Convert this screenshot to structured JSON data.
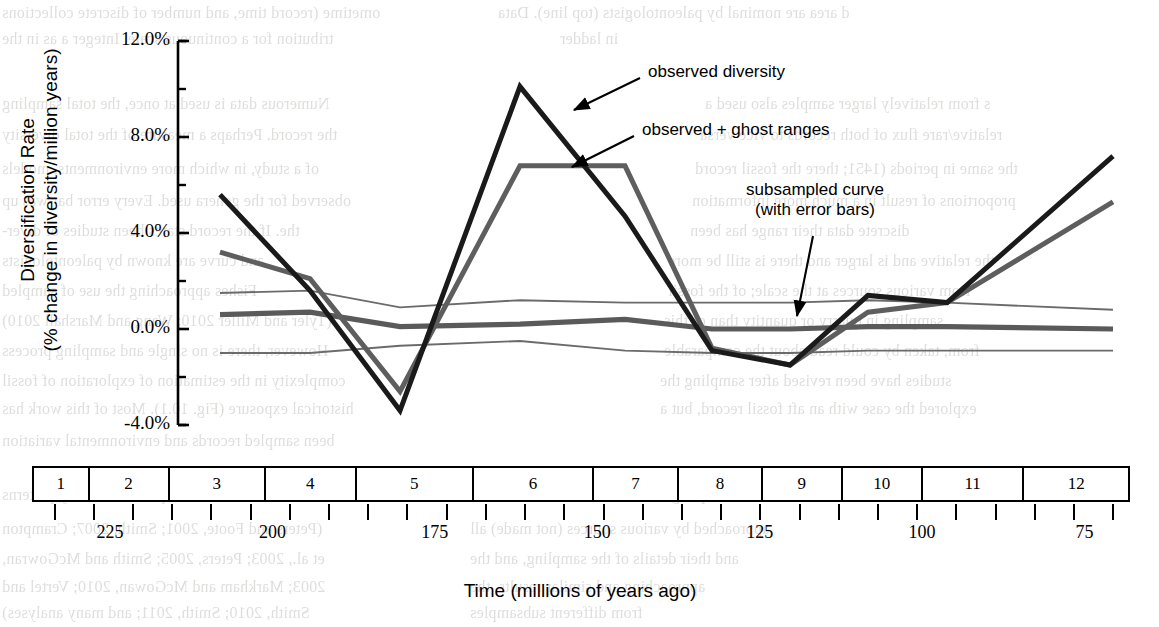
{
  "figure": {
    "y_axis": {
      "title_line1": "Diversification Rate",
      "title_line2": "(% change in diversity/million years)",
      "ticks": [
        "12.0%",
        "8.0%",
        "4.0%",
        "0.0%",
        "-4.0%"
      ]
    },
    "x_axis": {
      "title": "Time (millions of years ago)",
      "bins": [
        "1",
        "2",
        "3",
        "4",
        "5",
        "6",
        "7",
        "8",
        "9",
        "10",
        "11",
        "12"
      ],
      "tick_labels": [
        "225",
        "200",
        "175",
        "150",
        "125",
        "100",
        "75"
      ]
    },
    "annotations": [
      {
        "name": "observed-diversity",
        "text": "observed diversity"
      },
      {
        "name": "observed-ghost-ranges",
        "text": "observed + ghost ranges"
      },
      {
        "name": "subsampled-curve",
        "line1": "subsampled curve",
        "line2": "(with error bars)"
      }
    ],
    "colors": {
      "observed": "#1a1a1a",
      "ghost": "#5e5e5e",
      "subsampled": "#5a5a5a",
      "error_band": "#6b6b6b",
      "axis": "#000000",
      "background": "#ffffff"
    }
  },
  "chart_data": {
    "type": "line",
    "title": "",
    "xlabel": "Time (millions of years ago)",
    "ylabel": "Diversification Rate (% change in diversity/million years)",
    "ylim": [
      -4.0,
      12.0
    ],
    "yticks": [
      -4.0,
      0.0,
      4.0,
      8.0,
      12.0
    ],
    "ytick_labels": [
      "-4.0%",
      "0.0%",
      "4.0%",
      "8.0%",
      "12.0%"
    ],
    "grid": false,
    "legend": "annotations-with-arrows",
    "x": [
      3,
      4,
      5,
      6,
      7,
      8,
      9,
      10,
      11,
      12
    ],
    "x_bins": [
      "3",
      "4",
      "5",
      "6",
      "7",
      "8",
      "9",
      "10",
      "11",
      "12"
    ],
    "x_time_mya": [
      212,
      193,
      178,
      162,
      146,
      130,
      116,
      101,
      88,
      74
    ],
    "series": [
      {
        "name": "observed diversity",
        "color": "#1a1a1a",
        "values": [
          5.6,
          1.6,
          -3.4,
          10.1,
          4.7,
          -0.9,
          -1.5,
          1.4,
          1.1,
          7.2
        ]
      },
      {
        "name": "observed + ghost ranges",
        "color": "#5e5e5e",
        "values": [
          3.2,
          2.1,
          -2.6,
          6.8,
          6.8,
          -0.8,
          -1.5,
          0.7,
          1.1,
          5.3
        ]
      },
      {
        "name": "subsampled curve",
        "color": "#5a5a5a",
        "values": [
          0.6,
          0.7,
          0.1,
          0.2,
          0.4,
          0.0,
          0.0,
          0.1,
          0.1,
          0.0
        ]
      },
      {
        "name": "subsampled upper error",
        "color": "#6b6b6b",
        "values": [
          1.5,
          1.6,
          0.9,
          1.2,
          1.1,
          1.1,
          1.1,
          1.2,
          1.1,
          0.8
        ]
      },
      {
        "name": "subsampled lower error",
        "color": "#6b6b6b",
        "values": [
          -1.0,
          -1.0,
          -0.7,
          -0.5,
          -0.9,
          -1.0,
          -1.0,
          -0.9,
          -0.9,
          -0.9
        ]
      }
    ]
  },
  "bleed_text": {
    "lines": [
      {
        "t": "d area are nominal by paleontologists (top line). Data",
        "x": 498,
        "y": 4
      },
      {
        "t": "in ladder",
        "x": 560,
        "y": 30
      },
      {
        "t": "s from relatively larger samples also used a",
        "x": 705,
        "y": 95
      },
      {
        "t": "relative/rare   flux of both records to vice versa",
        "x": 700,
        "y": 126
      },
      {
        "t": "the same in   periods (1451; there the fossil record",
        "x": 695,
        "y": 160
      },
      {
        "t": "proportions   of result in a much more information",
        "x": 692,
        "y": 192
      },
      {
        "t": "discrete data   their range has been",
        "x": 690,
        "y": 222
      },
      {
        "t": "the relative and is larger and there is still be more",
        "x": 668,
        "y": 252
      },
      {
        "t": "from various sources at the scale; of the fossil",
        "x": 668,
        "y": 282
      },
      {
        "t": "sampling in quarry or quantity than of this",
        "x": 664,
        "y": 312
      },
      {
        "t": "from, taken by could read about the comparable",
        "x": 664,
        "y": 342
      },
      {
        "t": "studies have been revised after sampling the",
        "x": 660,
        "y": 372
      },
      {
        "t": "explored the case with an aft fossil record, but a",
        "x": 660,
        "y": 400
      },
      {
        "t": "and sampling the total amount in detail, and",
        "x": 470,
        "y": 486
      },
      {
        "t": "approached by various sources (not made) all",
        "x": 470,
        "y": 520
      },
      {
        "t": "and their details of the sampling, and the",
        "x": 470,
        "y": 550
      },
      {
        "t": "approaching and similar results, the",
        "x": 470,
        "y": 578
      },
      {
        "t": "from different subsamples",
        "x": 470,
        "y": 604
      }
    ],
    "right": [
      {
        "t": "ometime (record time, and number of discrete collections",
        "x": 2,
        "y": 4
      },
      {
        "t": "tribution for a continuous scale. Integer a as in the",
        "x": 2,
        "y": 30
      },
      {
        "t": "Numerous data is used at once, the total sampling",
        "x": 2,
        "y": 95
      },
      {
        "t": "the record. Perhaps a measure of the total diversity",
        "x": 2,
        "y": 126
      },
      {
        "t": "of a study, in which more environments, models",
        "x": 2,
        "y": 160
      },
      {
        "t": "observed for the genera used. Every error bar was up",
        "x": 2,
        "y": 192
      },
      {
        "t": "the. If the record states been studies of diver-",
        "x": 2,
        "y": 222
      },
      {
        "t": "and curve are known by paleontologists",
        "x": 2,
        "y": 252
      },
      {
        "t": "Fishes   approaching the use of sampled",
        "x": 2,
        "y": 282
      },
      {
        "t": "(Tyler and Miller 2010; Wang and Marshall 2010)",
        "x": 2,
        "y": 312
      },
      {
        "t": "However, there is no single and sampling process",
        "x": 2,
        "y": 342
      },
      {
        "t": "complexity in the estimation of exploration of fossil",
        "x": 2,
        "y": 372
      },
      {
        "t": "historical exposure (Fig. 10.1). Most of this work has",
        "x": 2,
        "y": 400
      },
      {
        "t": "been sampled records and environmental variation",
        "x": 2,
        "y": 432
      },
      {
        "t": "classes, rich and specific diversity patterns",
        "x": 2,
        "y": 486
      },
      {
        "t": "(Peters and Foote, 2001; Smith, 2007; Crampton",
        "x": 2,
        "y": 520
      },
      {
        "t": "et al., 2003; Peters, 2005; Smith and McGowran,",
        "x": 2,
        "y": 550
      },
      {
        "t": "2003; Markham and McGowan, 2010; Vertel and",
        "x": 2,
        "y": 578
      },
      {
        "t": "Smith, 2010; Smith, 2011; and many analyses)",
        "x": 2,
        "y": 604
      }
    ]
  }
}
